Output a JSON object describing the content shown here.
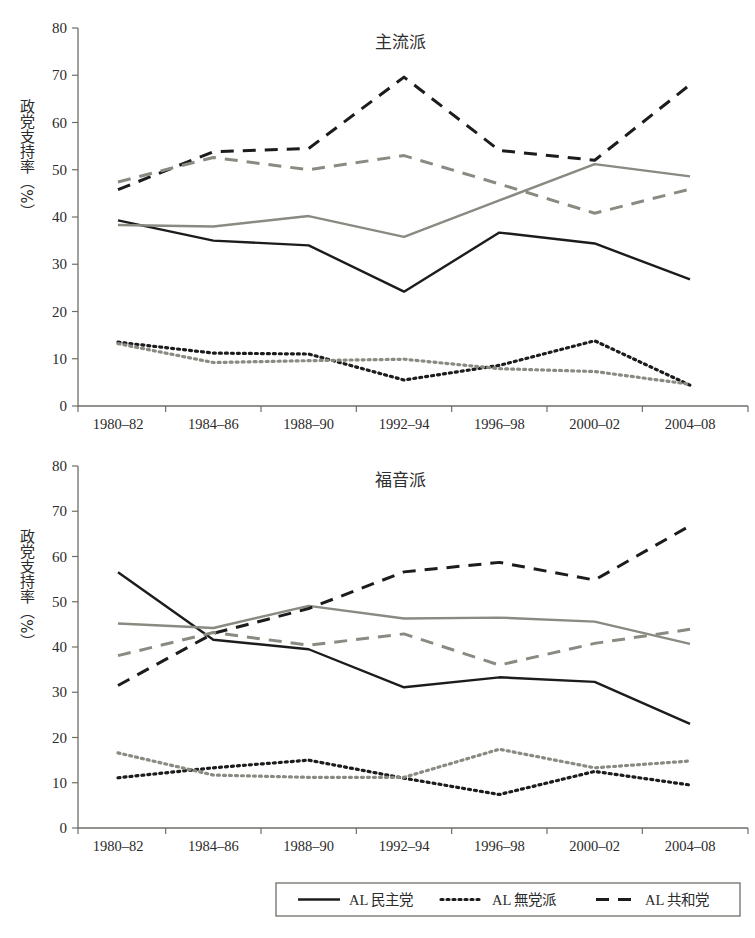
{
  "figure": {
    "axis_title_y": "政党支持率（%）",
    "y_ticks": [
      "0",
      "10",
      "20",
      "30",
      "40",
      "50",
      "60",
      "70",
      "80"
    ],
    "x_ticks": [
      "1980–82",
      "1984–86",
      "1988–90",
      "1992–94",
      "1996–98",
      "2000–02",
      "2004–08"
    ]
  },
  "legend": {
    "items": [
      {
        "label": "AL 民主党",
        "style": "solid",
        "color": "#1c1c1c"
      },
      {
        "label": "AL 無党派",
        "style": "dotted",
        "color": "#1c1c1c"
      },
      {
        "label": "AL 共和党",
        "style": "dashed",
        "color": "#1c1c1c"
      }
    ]
  },
  "colors": {
    "dark": "#1c1c1c",
    "gray": "#8a8a82",
    "axis": "#6e6e68",
    "background": "#ffffff"
  },
  "chart_data": [
    {
      "type": "line",
      "title": "主流派",
      "xlabel": "",
      "ylabel": "政党支持率（%）",
      "categories": [
        "1980–82",
        "1984–86",
        "1988–90",
        "1992–94",
        "1996–98",
        "2000–02",
        "2004–08"
      ],
      "ylim": [
        0,
        80
      ],
      "ytick_step": 10,
      "grid": false,
      "legend_position": "bottom",
      "series": [
        {
          "name": "AL 民主党 (dark solid)",
          "style": "solid",
          "color": "#1c1c1c",
          "values": [
            39.3,
            35.0,
            34.0,
            24.2,
            36.7,
            34.4,
            26.8
          ]
        },
        {
          "name": "AL 民主党 (gray solid)",
          "style": "solid",
          "color": "#8a8a82",
          "values": [
            38.3,
            38.0,
            40.2,
            35.8,
            43.5,
            51.2,
            48.6
          ]
        },
        {
          "name": "AL 無党派 (dark dotted)",
          "style": "dotted",
          "color": "#1c1c1c",
          "values": [
            13.5,
            11.2,
            11.0,
            5.5,
            8.6,
            13.8,
            4.4
          ]
        },
        {
          "name": "AL 無党派 (gray dotted)",
          "style": "dotted",
          "color": "#8a8a82",
          "values": [
            13.2,
            9.2,
            9.6,
            9.9,
            7.9,
            7.3,
            4.6
          ]
        },
        {
          "name": "AL 共和党 (dark dashed)",
          "style": "dashed",
          "color": "#1c1c1c",
          "values": [
            45.8,
            53.8,
            54.5,
            69.6,
            54.1,
            52.0,
            68.0
          ]
        },
        {
          "name": "AL 共和党 (gray dashed)",
          "style": "dashed",
          "color": "#8a8a82",
          "values": [
            47.4,
            52.6,
            50.0,
            53.0,
            47.0,
            40.8,
            45.9
          ]
        }
      ]
    },
    {
      "type": "line",
      "title": "福音派",
      "xlabel": "",
      "ylabel": "政党支持率（%）",
      "categories": [
        "1980–82",
        "1984–86",
        "1988–90",
        "1992–94",
        "1996–98",
        "2000–02",
        "2004–08"
      ],
      "ylim": [
        0,
        80
      ],
      "ytick_step": 10,
      "grid": false,
      "legend_position": "bottom",
      "series": [
        {
          "name": "AL 民主党 (dark solid)",
          "style": "solid",
          "color": "#1c1c1c",
          "values": [
            56.5,
            41.6,
            39.5,
            31.1,
            33.3,
            32.3,
            23.0
          ]
        },
        {
          "name": "AL 民主党 (gray solid)",
          "style": "solid",
          "color": "#8a8a82",
          "values": [
            45.2,
            44.2,
            49.1,
            46.3,
            46.5,
            45.6,
            40.7
          ]
        },
        {
          "name": "AL 無党派 (dark dotted)",
          "style": "dotted",
          "color": "#1c1c1c",
          "values": [
            11.1,
            13.3,
            15.0,
            11.0,
            7.4,
            12.5,
            9.5
          ]
        },
        {
          "name": "AL 無党派 (gray dotted)",
          "style": "dotted",
          "color": "#8a8a82",
          "values": [
            16.6,
            11.7,
            11.2,
            11.2,
            17.4,
            13.3,
            14.8
          ]
        },
        {
          "name": "AL 共和党 (dark dashed)",
          "style": "dashed",
          "color": "#1c1c1c",
          "values": [
            31.5,
            43.0,
            48.5,
            56.6,
            58.7,
            54.8,
            66.8
          ]
        },
        {
          "name": "AL 共和党 (gray dashed)",
          "style": "dashed",
          "color": "#8a8a82",
          "values": [
            38.1,
            43.2,
            40.4,
            42.9,
            36.0,
            40.8,
            43.9
          ]
        }
      ]
    }
  ]
}
